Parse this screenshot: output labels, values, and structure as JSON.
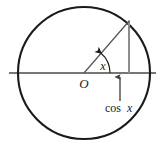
{
  "figure": {
    "kind": "unit-circle-cosine-diagram",
    "canvas": {
      "width": 164,
      "height": 151,
      "background": "#ffffff"
    },
    "colors": {
      "circle_stroke": "#1a1a1a",
      "axis_stroke": "#4a4a4a",
      "radius_stroke": "#555555",
      "drop_line_stroke": "#8c8c8c",
      "arrow_stroke": "#3a3a3a",
      "label_fill": "#1a1a1a"
    },
    "circle": {
      "cx": 84,
      "cy": 73,
      "r": 66,
      "stroke_width": 2.1
    },
    "axis": {
      "x1": 9,
      "y1": 73,
      "x2": 156,
      "y2": 73,
      "stroke_width": 1.3
    },
    "radius": {
      "x1": 84,
      "y1": 73,
      "x2": 129,
      "y2": 21,
      "stroke_width": 1.2
    },
    "drop_line": {
      "x": 129,
      "y_top": 21,
      "y_bottom": 73,
      "stroke_width": 2.0
    },
    "angle_arc": {
      "cx": 84,
      "cy": 73,
      "r": 26,
      "start_deg": 0,
      "end_deg": 49
    },
    "cos_arrow": {
      "x": 120,
      "y_tail": 101,
      "y_head": 76
    }
  },
  "labels": {
    "origin": "O",
    "angle": "x",
    "cosine_prefix": "cos",
    "cosine_variable": "x",
    "cosine_full": "cos x"
  }
}
